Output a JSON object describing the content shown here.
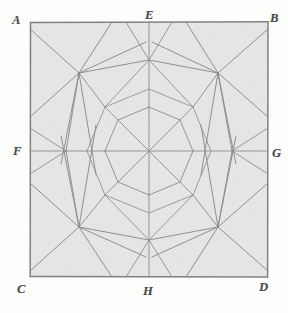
{
  "figure": {
    "kind": "hand-drawn-geometric-diagram",
    "medium": "pencil sketch on paper",
    "title_visible": false,
    "canvas": {
      "width": 288,
      "height": 313
    },
    "paper": {
      "fill": "#f1f1ef",
      "background": "#fdfdfc",
      "texture": "graphite-shaded"
    },
    "stroke": {
      "border_color": "#6e6e6e",
      "line_color": "#8a8a8a",
      "faint_line_color": "#a8a8a8",
      "border_width": 1.4,
      "line_width": 0.9
    },
    "square": {
      "name": "ABCD",
      "left": 30,
      "top": 22,
      "right": 268,
      "bottom": 277
    },
    "labels": [
      {
        "id": "A",
        "text": "A",
        "role": "square-corner-top-left",
        "x": 12,
        "y": 14
      },
      {
        "id": "B",
        "text": "B",
        "role": "square-corner-top-right",
        "x": 270,
        "y": 12
      },
      {
        "id": "C",
        "text": "C",
        "role": "square-corner-bottom-left",
        "x": 17,
        "y": 283
      },
      {
        "id": "D",
        "text": "D",
        "role": "square-corner-bottom-right",
        "x": 259,
        "y": 281
      },
      {
        "id": "E",
        "text": "E",
        "role": "midpoint-top-edge",
        "x": 145,
        "y": 9
      },
      {
        "id": "F",
        "text": "F",
        "role": "midpoint-left-edge",
        "x": 13,
        "y": 145
      },
      {
        "id": "G",
        "text": "G",
        "role": "midpoint-right-edge",
        "x": 272,
        "y": 147
      },
      {
        "id": "H",
        "text": "H",
        "role": "midpoint-bottom-edge",
        "x": 143,
        "y": 285
      }
    ],
    "points": {
      "A": [
        30,
        22
      ],
      "B": [
        268,
        22
      ],
      "C": [
        30,
        277
      ],
      "D": [
        268,
        277
      ],
      "E": [
        149,
        22
      ],
      "F": [
        30,
        151
      ],
      "G": [
        268,
        151
      ],
      "H": [
        149,
        277
      ],
      "center": [
        149,
        151
      ],
      "node_upper_left": [
        79,
        73
      ],
      "node_upper_right": [
        218,
        73
      ],
      "node_lower_left": [
        79,
        227
      ],
      "node_lower_right": [
        218,
        227
      ]
    },
    "construction": {
      "outer_hexagon_vertices": [
        [
          79,
          73
        ],
        [
          149,
          60
        ],
        [
          218,
          73
        ],
        [
          232,
          151
        ],
        [
          218,
          227
        ],
        [
          149,
          240
        ],
        [
          79,
          227
        ],
        [
          66,
          151
        ]
      ],
      "inner_octagon_radius": 44,
      "mid_octagon_radius": 62,
      "center_spokes": 8,
      "quadrant_star_spokes": 6
    }
  }
}
